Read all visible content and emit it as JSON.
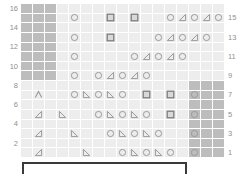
{
  "chart_data": {
    "type": "table",
    "columns": 17,
    "rows": 16,
    "cell_width": 12,
    "cell_height": 9.625,
    "colors": {
      "grid_background": "#f0f0f0",
      "cell_plain": "#ededed",
      "cell_shaded": "#bdbdbd",
      "gridline": "#ffffff",
      "symbol": "#9a9a9a",
      "symbol_dark": "#7d7d7d",
      "row_number": "#8f8f8f",
      "bracket": "#3a3a3a"
    },
    "row_numbers_left": [
      "16",
      "14",
      "12",
      "10",
      "8",
      "6",
      "4",
      "2"
    ],
    "row_numbers_right": [
      "15",
      "13",
      "11",
      "9",
      "7",
      "5",
      "3",
      "1"
    ],
    "legend_note": "",
    "symbols_key": {
      "circle": "yarn-over",
      "square": "bobble",
      "tri-left": "left-leaning-decrease",
      "tri-right": "right-leaning-decrease",
      "tri-left-solid": "ssk",
      "tri-right-solid": "k2tog",
      "chevron": "centered-double-decrease"
    },
    "shaded_blocks": [
      {
        "name": "top-left-no-stitch",
        "col_start": 0,
        "col_end": 2,
        "row_start": 0,
        "row_end": 7
      },
      {
        "name": "bottom-right-no-stitch",
        "col_start": 14,
        "col_end": 16,
        "row_start": 8,
        "row_end": 15
      }
    ],
    "rows_data": [
      {
        "row": 16,
        "side": "left",
        "cells": []
      },
      {
        "row": 15,
        "side": "right",
        "cells": [
          {
            "col": 4,
            "sym": "circle"
          },
          {
            "col": 7,
            "sym": "square"
          },
          {
            "col": 9,
            "sym": "square"
          },
          {
            "col": 12,
            "sym": "circle"
          },
          {
            "col": 13,
            "sym": "tri-left"
          },
          {
            "col": 14,
            "sym": "circle"
          },
          {
            "col": 15,
            "sym": "tri-left"
          },
          {
            "col": 16,
            "sym": "circle"
          }
        ]
      },
      {
        "row": 14,
        "side": "left",
        "cells": []
      },
      {
        "row": 13,
        "side": "right",
        "cells": [
          {
            "col": 4,
            "sym": "circle"
          },
          {
            "col": 7,
            "sym": "square"
          },
          {
            "col": 11,
            "sym": "circle"
          },
          {
            "col": 12,
            "sym": "tri-left"
          },
          {
            "col": 13,
            "sym": "circle"
          },
          {
            "col": 14,
            "sym": "tri-left"
          },
          {
            "col": 15,
            "sym": "circle"
          }
        ]
      },
      {
        "row": 12,
        "side": "left",
        "cells": []
      },
      {
        "row": 11,
        "side": "right",
        "cells": [
          {
            "col": 4,
            "sym": "circle"
          },
          {
            "col": 9,
            "sym": "circle"
          },
          {
            "col": 10,
            "sym": "tri-left"
          },
          {
            "col": 11,
            "sym": "circle"
          },
          {
            "col": 12,
            "sym": "tri-left"
          },
          {
            "col": 13,
            "sym": "circle"
          }
        ]
      },
      {
        "row": 10,
        "side": "left",
        "cells": []
      },
      {
        "row": 9,
        "side": "right",
        "cells": [
          {
            "col": 4,
            "sym": "circle"
          },
          {
            "col": 6,
            "sym": "circle"
          },
          {
            "col": 7,
            "sym": "tri-left"
          },
          {
            "col": 8,
            "sym": "circle"
          },
          {
            "col": 9,
            "sym": "tri-left"
          },
          {
            "col": 10,
            "sym": "circle"
          }
        ]
      },
      {
        "row": 8,
        "side": "left",
        "cells": []
      },
      {
        "row": 7,
        "side": "right",
        "cells": [
          {
            "col": 1,
            "sym": "chevron"
          },
          {
            "col": 4,
            "sym": "circle"
          },
          {
            "col": 5,
            "sym": "tri-right"
          },
          {
            "col": 6,
            "sym": "circle"
          },
          {
            "col": 7,
            "sym": "tri-right"
          },
          {
            "col": 8,
            "sym": "circle"
          },
          {
            "col": 10,
            "sym": "square"
          },
          {
            "col": 12,
            "sym": "square"
          },
          {
            "col": 14,
            "sym": "circle"
          }
        ]
      },
      {
        "row": 6,
        "side": "left",
        "cells": []
      },
      {
        "row": 5,
        "side": "right",
        "cells": [
          {
            "col": 1,
            "sym": "tri-left"
          },
          {
            "col": 3,
            "sym": "tri-right"
          },
          {
            "col": 6,
            "sym": "circle"
          },
          {
            "col": 7,
            "sym": "tri-right"
          },
          {
            "col": 8,
            "sym": "circle"
          },
          {
            "col": 9,
            "sym": "tri-right"
          },
          {
            "col": 10,
            "sym": "circle"
          },
          {
            "col": 12,
            "sym": "square"
          },
          {
            "col": 14,
            "sym": "circle"
          }
        ]
      },
      {
        "row": 4,
        "side": "left",
        "cells": []
      },
      {
        "row": 3,
        "side": "right",
        "cells": [
          {
            "col": 1,
            "sym": "tri-left"
          },
          {
            "col": 4,
            "sym": "tri-right"
          },
          {
            "col": 7,
            "sym": "circle"
          },
          {
            "col": 8,
            "sym": "tri-right"
          },
          {
            "col": 9,
            "sym": "circle"
          },
          {
            "col": 10,
            "sym": "tri-right"
          },
          {
            "col": 11,
            "sym": "circle"
          },
          {
            "col": 14,
            "sym": "circle"
          }
        ]
      },
      {
        "row": 2,
        "side": "left",
        "cells": []
      },
      {
        "row": 1,
        "side": "right",
        "cells": [
          {
            "col": 1,
            "sym": "tri-left"
          },
          {
            "col": 5,
            "sym": "tri-right"
          },
          {
            "col": 8,
            "sym": "circle"
          },
          {
            "col": 9,
            "sym": "tri-right"
          },
          {
            "col": 10,
            "sym": "circle"
          },
          {
            "col": 11,
            "sym": "tri-right"
          },
          {
            "col": 12,
            "sym": "circle"
          },
          {
            "col": 14,
            "sym": "circle"
          }
        ]
      }
    ],
    "repeat_bracket": {
      "label": "",
      "col_start": 0,
      "col_end": 13
    }
  }
}
